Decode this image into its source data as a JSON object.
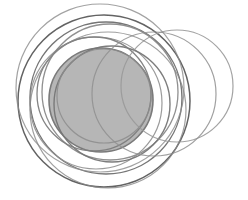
{
  "figure": {
    "width": 248,
    "height": 200,
    "background_color": "#ffffff"
  },
  "chart_data": {
    "type": "scatter",
    "subtitle": "",
    "xlabel": "",
    "ylabel": "",
    "xlim": [
      0,
      248
    ],
    "ylim": [
      0,
      200
    ],
    "grid": false,
    "legend": false,
    "legend_position": "none",
    "tick_labels_x": [],
    "tick_labels_y": [],
    "annotations": [],
    "background_color": "#ffffff",
    "marker_shape": "circle",
    "series": [
      {
        "name": "filled-disc",
        "shape": "circle",
        "cx": 101,
        "cy": 100,
        "r": 52,
        "fill": "#a9a9a9",
        "fill_opacity": 0.85,
        "stroke": "#7a7a7a",
        "stroke_width": 1.6,
        "stroke_opacity": 1
      },
      {
        "name": "outer-dark-ring",
        "shape": "circle",
        "cx": 104,
        "cy": 101,
        "r": 86,
        "fill": "none",
        "fill_opacity": 0,
        "stroke": "#636363",
        "stroke_width": 1.5,
        "stroke_opacity": 1
      },
      {
        "name": "second-dark-ring",
        "shape": "circle",
        "cx": 106,
        "cy": 98,
        "r": 76,
        "fill": "none",
        "fill_opacity": 0,
        "stroke": "#6e6e6e",
        "stroke_width": 1.4,
        "stroke_opacity": 0.95
      },
      {
        "name": "mid-ring-upper",
        "shape": "circle",
        "cx": 110,
        "cy": 92,
        "r": 68,
        "fill": "none",
        "fill_opacity": 0,
        "stroke": "#8a8a8a",
        "stroke_width": 1.3,
        "stroke_opacity": 0.95
      },
      {
        "name": "mid-ring-left",
        "shape": "circle",
        "cx": 96,
        "cy": 103,
        "r": 66,
        "fill": "none",
        "fill_opacity": 0,
        "stroke": "#909090",
        "stroke_width": 1.2,
        "stroke_opacity": 0.9
      },
      {
        "name": "tilted-ring-a",
        "shape": "circle",
        "cx": 112,
        "cy": 104,
        "r": 58,
        "fill": "none",
        "fill_opacity": 0,
        "stroke": "#767676",
        "stroke_width": 1.4,
        "stroke_opacity": 0.95
      },
      {
        "name": "tilted-ring-b",
        "shape": "circle",
        "cx": 94,
        "cy": 94,
        "r": 57,
        "fill": "none",
        "fill_opacity": 0,
        "stroke": "#7d7d7d",
        "stroke_width": 1.3,
        "stroke_opacity": 0.95
      },
      {
        "name": "inner-ring-small",
        "shape": "circle",
        "cx": 104,
        "cy": 96,
        "r": 47,
        "fill": "none",
        "fill_opacity": 0,
        "stroke": "#8c8c8c",
        "stroke_width": 1.2,
        "stroke_opacity": 0.85
      },
      {
        "name": "right-light-ring",
        "shape": "circle",
        "cx": 177,
        "cy": 86,
        "r": 56,
        "fill": "none",
        "fill_opacity": 0,
        "stroke": "#999999",
        "stroke_width": 1.2,
        "stroke_opacity": 0.9
      },
      {
        "name": "right-inner-ring",
        "shape": "circle",
        "cx": 154,
        "cy": 94,
        "r": 62,
        "fill": "none",
        "fill_opacity": 0,
        "stroke": "#8f8f8f",
        "stroke_width": 1.2,
        "stroke_opacity": 0.85
      },
      {
        "name": "lower-sweep-ring",
        "shape": "circle",
        "cx": 100,
        "cy": 88,
        "r": 84,
        "fill": "none",
        "fill_opacity": 0,
        "stroke": "#8b8b8b",
        "stroke_width": 1.2,
        "stroke_opacity": 0.8
      },
      {
        "name": "upper-sweep-ring",
        "shape": "circle",
        "cx": 108,
        "cy": 110,
        "r": 78,
        "fill": "none",
        "fill_opacity": 0,
        "stroke": "#878787",
        "stroke_width": 1.2,
        "stroke_opacity": 0.8
      }
    ]
  }
}
